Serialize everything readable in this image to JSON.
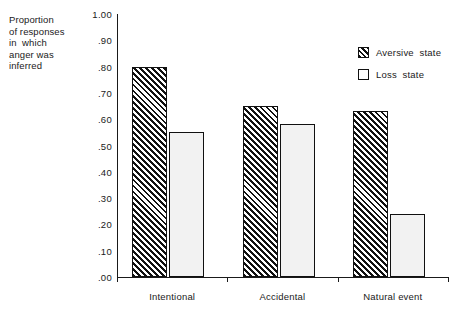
{
  "chart_data": {
    "type": "bar",
    "title": "",
    "xlabel": "",
    "ylabel": "Proportion of responses in which anger was inferred",
    "ylabel_lines": [
      "Proportion",
      "of responses",
      "in  which",
      "anger was",
      "inferred"
    ],
    "categories": [
      "Intentional",
      "Accidental",
      "Natural event"
    ],
    "series": [
      {
        "name": "Aversive state",
        "pattern": "diagonal-hatch",
        "values": [
          0.8,
          0.65,
          0.63
        ]
      },
      {
        "name": "Loss state",
        "pattern": "solid-light",
        "values": [
          0.55,
          0.58,
          0.24
        ]
      }
    ],
    "ylim": [
      0.0,
      1.0
    ],
    "ytick_values": [
      0.0,
      0.1,
      0.2,
      0.3,
      0.4,
      0.5,
      0.6,
      0.7,
      0.8,
      0.9,
      1.0
    ],
    "ytick_labels": [
      ".00",
      ".10",
      ".20",
      ".30",
      ".40",
      ".50",
      ".60",
      ".70",
      ".80",
      ".90",
      "1.00"
    ],
    "grid": false,
    "legend_position": "top-right",
    "colors": {
      "axis": "#1a1a1a",
      "bar_outline": "#111111",
      "hatch": "#111111",
      "loss_fill": "#f2f2f2",
      "background": "#ffffff"
    }
  },
  "legend": {
    "items": [
      {
        "label": "Aversive  state",
        "pattern": "diagonal-hatch"
      },
      {
        "label": "Loss  state",
        "pattern": "solid-light"
      }
    ]
  }
}
